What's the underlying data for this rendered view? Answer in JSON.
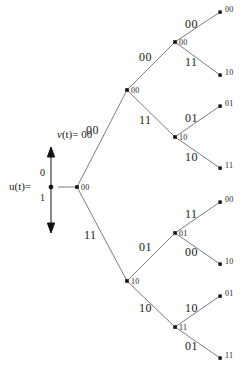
{
  "figure": {
    "background_color": "#ffffff",
    "line_color": "#6e6e6e",
    "node_color": "#111111",
    "text_color": "#1a1a1a"
  },
  "axis": {
    "u_label_var": "u",
    "u_label_paren": "(t)=",
    "u_label_full": "u(t)=",
    "tick_top": "0",
    "tick_bottom": "1"
  },
  "v_label": {
    "var": "v",
    "rest": "(t)= 00",
    "full": "v(t)= 00"
  },
  "nodes": {
    "root": "00",
    "d1_upper": "00",
    "d1_lower": "10",
    "d2_a": "00",
    "d2_b": "10",
    "d2_c": "01",
    "d2_d": "11"
  },
  "edge_labels": {
    "root_to_upper": "00",
    "root_to_lower": "11",
    "upper_to_a": "00",
    "upper_to_b": "11",
    "lower_to_c": "01",
    "lower_to_d": "10",
    "a_to_leaf1": "00",
    "a_to_leaf2": "11",
    "b_to_leaf3": "01",
    "b_to_leaf4": "10",
    "c_to_leaf5": "11",
    "c_to_leaf6": "00",
    "d_to_leaf7": "10",
    "d_to_leaf8": "01"
  },
  "leaves": {
    "leaf1": "00",
    "leaf2": "10",
    "leaf3": "01",
    "leaf4": "11",
    "leaf5": "00",
    "leaf6": "10",
    "leaf7": "01",
    "leaf8": "11"
  }
}
